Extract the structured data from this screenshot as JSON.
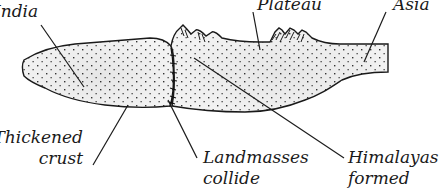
{
  "diagram": {
    "type": "geological cross-section",
    "colors": {
      "outline": "#1a1a1a",
      "fill": "#eeeeee",
      "stipple": "#333333",
      "background": "#ffffff"
    },
    "labels": {
      "india": "India",
      "plateau": "Plateau",
      "asia": "Asia",
      "thickened_crust_line1": "Thickened",
      "thickened_crust_line2": "crust",
      "landmasses_collide_line1": "Landmasses",
      "landmasses_collide_line2": "collide",
      "himalayas_formed_line1": "Himalayas",
      "himalayas_formed_line2": "formed"
    },
    "regions": [
      {
        "name": "India landmass",
        "position": "left"
      },
      {
        "name": "Asia landmass",
        "position": "right"
      },
      {
        "name": "Collision zone",
        "position": "center"
      },
      {
        "name": "Himalaya peaks",
        "position": "top-center"
      }
    ]
  }
}
